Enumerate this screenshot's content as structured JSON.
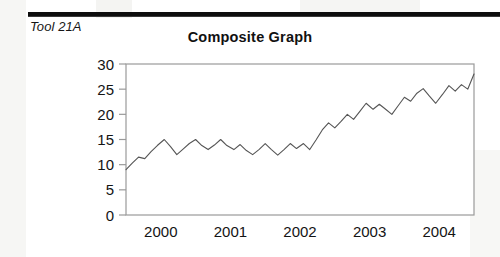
{
  "document": {
    "tool_label": "Tool 21A"
  },
  "chart_data": {
    "type": "line",
    "title": "Composite Graph",
    "xlabel": "",
    "ylabel": "",
    "ylim": [
      0,
      30
    ],
    "yticks": [
      0,
      5,
      10,
      15,
      20,
      25,
      30
    ],
    "xticks": [
      "2000",
      "2001",
      "2002",
      "2003",
      "2004"
    ],
    "xtick_positions": [
      0.5,
      1.5,
      2.5,
      3.5,
      4.5
    ],
    "xlim": [
      0,
      5
    ],
    "grid": false,
    "legend": false,
    "line_color": "#555555",
    "series": [
      {
        "name": "Composite",
        "x": [
          0.0,
          0.09,
          0.18,
          0.27,
          0.36,
          0.45,
          0.55,
          0.64,
          0.73,
          0.82,
          0.91,
          1.0,
          1.09,
          1.18,
          1.27,
          1.36,
          1.45,
          1.55,
          1.64,
          1.73,
          1.82,
          1.91,
          2.0,
          2.09,
          2.18,
          2.27,
          2.36,
          2.45,
          2.55,
          2.64,
          2.73,
          2.82,
          2.91,
          3.0,
          3.09,
          3.18,
          3.27,
          3.36,
          3.45,
          3.55,
          3.64,
          3.73,
          3.82,
          3.91,
          4.0,
          4.09,
          4.18,
          4.27,
          4.36,
          4.45,
          4.55,
          4.64,
          4.73,
          4.82,
          4.91,
          5.0
        ],
        "values": [
          9.0,
          10.3,
          11.5,
          11.2,
          12.6,
          13.8,
          15.0,
          13.6,
          12.0,
          13.1,
          14.2,
          15.0,
          13.8,
          13.0,
          13.9,
          15.0,
          13.8,
          13.0,
          14.0,
          12.8,
          12.0,
          13.0,
          14.2,
          13.0,
          11.9,
          13.0,
          14.2,
          13.2,
          14.2,
          13.0,
          14.9,
          16.9,
          18.3,
          17.3,
          18.6,
          20.0,
          19.0,
          20.6,
          22.2,
          21.0,
          22.0,
          21.0,
          20.0,
          21.7,
          23.4,
          22.6,
          24.2,
          25.1,
          23.6,
          22.2,
          24.0,
          25.7,
          24.6,
          25.9,
          25.0,
          28.0
        ]
      }
    ]
  }
}
